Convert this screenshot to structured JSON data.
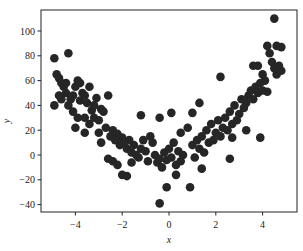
{
  "chart_data": {
    "type": "scatter",
    "title": "",
    "xlabel": "x",
    "ylabel": "y",
    "xlim": [
      -5.5,
      5.5
    ],
    "ylim": [
      -45,
      117
    ],
    "xticks": [
      -4,
      -2,
      0,
      2,
      4
    ],
    "yticks": [
      -40,
      -20,
      0,
      20,
      40,
      60,
      80,
      100
    ],
    "grid": false,
    "marker_color": "#262626",
    "points": [
      [
        -4.9,
        78
      ],
      [
        -4.8,
        65
      ],
      [
        -4.7,
        62
      ],
      [
        -4.6,
        58
      ],
      [
        -4.5,
        55
      ],
      [
        -4.4,
        50
      ],
      [
        -4.3,
        82
      ],
      [
        -4.9,
        40
      ],
      [
        -4.6,
        45
      ],
      [
        -4.2,
        45
      ],
      [
        -4.0,
        55
      ],
      [
        -3.9,
        60
      ],
      [
        -3.8,
        58
      ],
      [
        -3.7,
        50
      ],
      [
        -3.6,
        48
      ],
      [
        -3.5,
        42
      ],
      [
        -3.4,
        55
      ],
      [
        -3.3,
        36
      ],
      [
        -3.2,
        40
      ],
      [
        -3.1,
        46
      ],
      [
        -4.3,
        40
      ],
      [
        -4.1,
        35
      ],
      [
        -3.9,
        30
      ],
      [
        -3.6,
        30
      ],
      [
        -3.4,
        25
      ],
      [
        -3.2,
        30
      ],
      [
        -3.0,
        28
      ],
      [
        -2.9,
        37
      ],
      [
        -2.8,
        35
      ],
      [
        -2.7,
        22
      ],
      [
        -2.6,
        48
      ],
      [
        -3.6,
        18
      ],
      [
        -4.0,
        22
      ],
      [
        -2.5,
        15
      ],
      [
        -2.4,
        20
      ],
      [
        -2.3,
        12
      ],
      [
        -2.2,
        17
      ],
      [
        -2.1,
        8
      ],
      [
        -2.0,
        14
      ],
      [
        -1.9,
        10
      ],
      [
        -1.8,
        5
      ],
      [
        -1.7,
        12
      ],
      [
        -1.6,
        2
      ],
      [
        -1.5,
        8
      ],
      [
        -1.4,
        0
      ],
      [
        -1.3,
        -2
      ],
      [
        -1.2,
        5
      ],
      [
        -1.1,
        12
      ],
      [
        -1.0,
        3
      ],
      [
        -0.9,
        -5
      ],
      [
        -2.4,
        -5
      ],
      [
        -2.2,
        -8
      ],
      [
        -2.0,
        -16
      ],
      [
        -1.8,
        -17
      ],
      [
        -2.6,
        -3
      ],
      [
        -0.8,
        15
      ],
      [
        -0.7,
        10
      ],
      [
        -0.6,
        0
      ],
      [
        -0.5,
        -6
      ],
      [
        -0.4,
        -3
      ],
      [
        -0.3,
        -10
      ],
      [
        -0.2,
        2
      ],
      [
        -0.1,
        -4
      ],
      [
        0.0,
        5
      ],
      [
        0.1,
        -2
      ],
      [
        0.2,
        10
      ],
      [
        0.3,
        -8
      ],
      [
        0.4,
        3
      ],
      [
        0.5,
        -5
      ],
      [
        0.6,
        0
      ],
      [
        -0.4,
        -39
      ],
      [
        -0.1,
        -26
      ],
      [
        0.9,
        -26
      ],
      [
        -1.2,
        32
      ],
      [
        -0.4,
        30
      ],
      [
        0.1,
        34
      ],
      [
        0.5,
        18
      ],
      [
        0.8,
        22
      ],
      [
        1.0,
        8
      ],
      [
        1.1,
        -2
      ],
      [
        1.2,
        12
      ],
      [
        1.3,
        5
      ],
      [
        1.4,
        15
      ],
      [
        1.5,
        2
      ],
      [
        1.6,
        20
      ],
      [
        1.7,
        10
      ],
      [
        1.8,
        25
      ],
      [
        1.9,
        12
      ],
      [
        2.0,
        18
      ],
      [
        2.1,
        28
      ],
      [
        2.2,
        15
      ],
      [
        2.3,
        22
      ],
      [
        2.4,
        30
      ],
      [
        2.5,
        20
      ],
      [
        2.6,
        35
      ],
      [
        2.7,
        25
      ],
      [
        2.8,
        40
      ],
      [
        2.9,
        28
      ],
      [
        3.0,
        33
      ],
      [
        3.1,
        45
      ],
      [
        3.2,
        38
      ],
      [
        3.3,
        42
      ],
      [
        3.4,
        48
      ],
      [
        3.5,
        52
      ],
      [
        3.6,
        45
      ],
      [
        3.7,
        55
      ],
      [
        3.8,
        50
      ],
      [
        3.9,
        58
      ],
      [
        4.0,
        65
      ],
      [
        4.1,
        60
      ],
      [
        2.2,
        63
      ],
      [
        2.7,
        14
      ],
      [
        3.3,
        20
      ],
      [
        3.9,
        14
      ],
      [
        4.4,
        75
      ],
      [
        4.5,
        70
      ],
      [
        4.6,
        65
      ],
      [
        4.7,
        72
      ],
      [
        4.8,
        68
      ],
      [
        4.2,
        88
      ],
      [
        4.3,
        82
      ],
      [
        4.6,
        88
      ],
      [
        4.8,
        87
      ],
      [
        4.5,
        110
      ],
      [
        3.6,
        72
      ],
      [
        3.8,
        72
      ],
      [
        4.0,
        52
      ],
      [
        4.2,
        51
      ],
      [
        1.4,
        -11
      ],
      [
        2.6,
        -3
      ],
      [
        -4.7,
        48
      ],
      [
        -4.4,
        58
      ],
      [
        -4.1,
        48
      ],
      [
        -3.8,
        44
      ],
      [
        -3.0,
        18
      ],
      [
        -2.9,
        10
      ],
      [
        -1.6,
        -6
      ],
      [
        0.3,
        -16
      ],
      [
        1.0,
        34
      ],
      [
        1.3,
        42
      ]
    ]
  }
}
